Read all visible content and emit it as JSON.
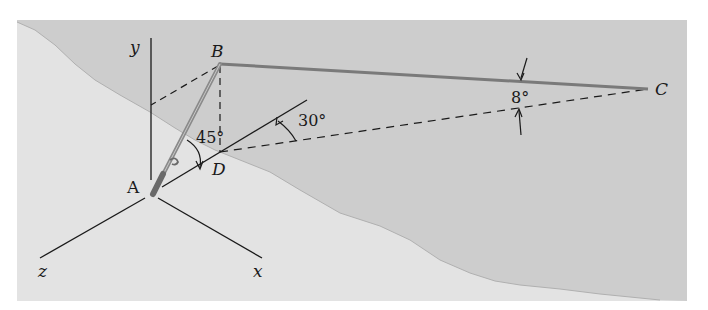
{
  "figure": {
    "colors": {
      "background": "#ffffff",
      "water": "#cdcdcd",
      "land": "#e3e3e3",
      "line": "#1a1a1a",
      "rod": "#8a8a8a",
      "fishing_line": "#7a7a7a"
    },
    "axes": {
      "x_label": "x",
      "y_label": "y",
      "z_label": "z"
    },
    "points": {
      "A": "A",
      "B": "B",
      "C": "C",
      "D": "D"
    },
    "angles": {
      "rod_elevation": "45°",
      "horizontal_offset": "30°",
      "line_depression": "8°"
    }
  }
}
